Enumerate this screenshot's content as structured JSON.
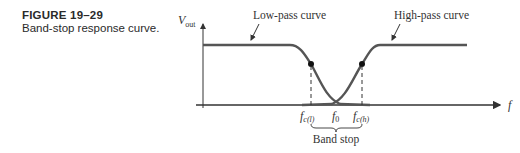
{
  "figure": {
    "number": "FIGURE 19–29",
    "title": "Band-stop response curve."
  },
  "diagram": {
    "y_axis_label": "V",
    "y_axis_label_sub": "out",
    "x_axis_label": "f",
    "curves": [
      {
        "name": "Low-pass curve",
        "label": "Low-pass curve"
      },
      {
        "name": "High-pass curve",
        "label": "High-pass curve"
      }
    ],
    "ticks": [
      {
        "main": "f",
        "sub": "c(l)"
      },
      {
        "main": "f",
        "sub": "0"
      },
      {
        "main": "f",
        "sub": "c(h)"
      }
    ],
    "band_label": "Band stop",
    "colors": {
      "curve": "#555555",
      "axis": "#333333",
      "text": "#333333"
    }
  }
}
